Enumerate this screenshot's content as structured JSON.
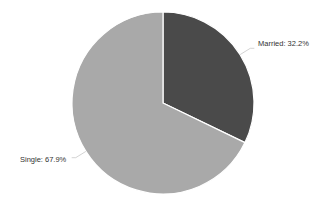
{
  "chart_data": {
    "type": "pie",
    "title": "",
    "categories": [
      "Married",
      "Single"
    ],
    "values": [
      32.2,
      67.9
    ],
    "unit": "%",
    "labels": [
      "Married: 32.2%",
      "Single: 67.9%"
    ],
    "colors": [
      "#4a4a4a",
      "#a9a9a9"
    ],
    "start_angle_deg": 0,
    "direction": "clockwise",
    "legend": "none",
    "data_labels": "outside with leader lines"
  },
  "slices": [
    {
      "name": "Married",
      "label": "Married: 32.2%",
      "value": 32.2,
      "color": "#4a4a4a"
    },
    {
      "name": "Single",
      "label": "Single: 67.9%",
      "value": 67.9,
      "color": "#a9a9a9"
    }
  ],
  "geometry": {
    "cx": 163,
    "cy": 103,
    "r": 91
  }
}
